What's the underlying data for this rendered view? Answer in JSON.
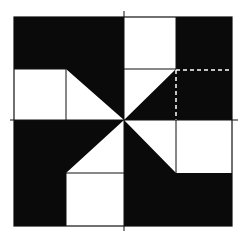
{
  "diagram": {
    "title": "",
    "colors": {
      "fill": "#0a0a0a",
      "background": "#ffffff",
      "line": "#111111",
      "dashed": "#ffffff"
    },
    "grid": {
      "left": 14,
      "right": 232,
      "top": 17,
      "bottom": 226,
      "cx": 124,
      "cy": 120,
      "q1x": 66,
      "q3x": 176,
      "q1y": 69,
      "q3y": 173
    },
    "labels": []
  }
}
